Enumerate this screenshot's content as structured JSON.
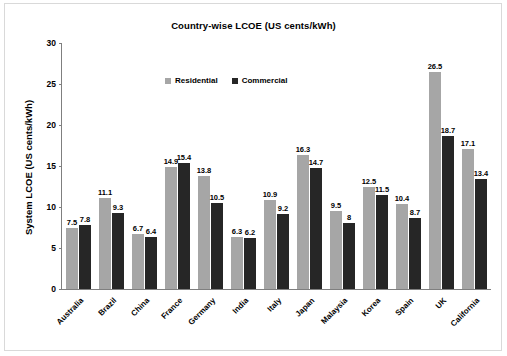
{
  "chart_data": {
    "type": "bar",
    "title": "Country-wise LCOE (US cents/kWh)",
    "xlabel": "",
    "ylabel": "System LCOE (US cents/kWh)",
    "ylim": [
      0,
      30
    ],
    "yticks": [
      0,
      5,
      10,
      15,
      20,
      25,
      30
    ],
    "grid": false,
    "legend_position": "top-center-inside",
    "categories": [
      "Australia",
      "Brazil",
      "China",
      "France",
      "Germany",
      "India",
      "Italy",
      "Japan",
      "Malaysia",
      "Korea",
      "Spain",
      "UK",
      "California"
    ],
    "series": [
      {
        "name": "Residential",
        "color": "#a6a6a6",
        "values": [
          7.5,
          11.1,
          6.7,
          14.9,
          13.8,
          6.3,
          10.9,
          16.3,
          9.5,
          12.5,
          10.4,
          26.5,
          17.1
        ],
        "labels": [
          "7.5",
          "11.1",
          "6.7",
          "14.9",
          "13.8",
          "6.3",
          "10.9",
          "16.3",
          "9.5",
          "12.5",
          "10.4",
          "26.5",
          "17.1"
        ]
      },
      {
        "name": "Commercial",
        "color": "#262626",
        "values": [
          7.8,
          9.3,
          6.4,
          15.4,
          10.5,
          6.2,
          9.2,
          14.7,
          8.0,
          11.5,
          8.7,
          18.7,
          13.4
        ],
        "labels": [
          "7.8",
          "9.3",
          "6.4",
          "15.4",
          "10.5",
          "6.2",
          "9.2",
          "14.7",
          "8",
          "11.5",
          "8.7",
          "18.7",
          "13.4"
        ]
      }
    ]
  }
}
